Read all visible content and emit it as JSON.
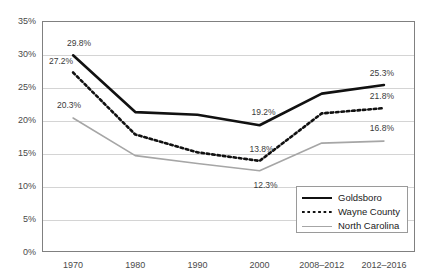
{
  "chart_data": {
    "type": "line",
    "title": "",
    "xlabel": "",
    "ylabel": "",
    "ylim": [
      0,
      35
    ],
    "yticks": [
      0,
      5,
      10,
      15,
      20,
      25,
      30,
      35
    ],
    "ytick_labels": [
      "0%",
      "5%",
      "10%",
      "15%",
      "20%",
      "25%",
      "30%",
      "35%"
    ],
    "grid": true,
    "legend_position": "bottom-right",
    "categories": [
      "1970",
      "1980",
      "1990",
      "2000",
      "2008–2012",
      "2012–2016"
    ],
    "series": [
      {
        "name": "Goldsboro",
        "color": "#111111",
        "style": "solid",
        "values": [
          29.8,
          21.2,
          20.8,
          19.2,
          24.0,
          25.3
        ],
        "labels": [
          {
            "index": 0,
            "text": "29.8%"
          },
          {
            "index": 3,
            "text": "19.2%"
          },
          {
            "index": 5,
            "text": "25.3%"
          }
        ]
      },
      {
        "name": "Wayne County",
        "color": "#111111",
        "style": "dotted",
        "values": [
          27.2,
          17.8,
          15.1,
          13.8,
          21.0,
          21.8
        ],
        "labels": [
          {
            "index": 0,
            "text": "27.2%"
          },
          {
            "index": 3,
            "text": "13.8%"
          },
          {
            "index": 5,
            "text": "21.8%"
          }
        ]
      },
      {
        "name": "North Carolina",
        "color": "#a6a6a6",
        "style": "solid-thin",
        "values": [
          20.3,
          14.6,
          13.4,
          12.3,
          16.5,
          16.8
        ],
        "labels": [
          {
            "index": 0,
            "text": "20.3%"
          },
          {
            "index": 3,
            "text": "12.3%"
          },
          {
            "index": 5,
            "text": "16.8%"
          }
        ]
      }
    ],
    "legend": [
      {
        "label": "Goldsboro",
        "swatch": "solid-black"
      },
      {
        "label": "Wayne County",
        "swatch": "dotted-black"
      },
      {
        "label": "North Carolina",
        "swatch": "solid-gray"
      }
    ]
  }
}
